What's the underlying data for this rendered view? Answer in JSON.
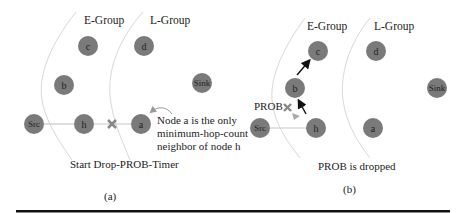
{
  "panels": [
    {
      "id": "a",
      "caption": "(a)",
      "groups": {
        "e_group": "E-Group",
        "l_group": "L-Group"
      },
      "nodes": {
        "src": "Src",
        "h": "h",
        "a": "a",
        "b": "b",
        "c": "c",
        "d": "d",
        "sink": "Sink"
      },
      "annotation": {
        "line1": "Node a  is the only",
        "line2": "minimum-hop-count",
        "line3": "neighbor of node h"
      },
      "status": "Start Drop-PROB-Timer"
    },
    {
      "id": "b",
      "caption": "(b)",
      "groups": {
        "e_group": "E-Group",
        "l_group": "L-Group"
      },
      "nodes": {
        "src": "Src",
        "h": "h",
        "a": "a",
        "b": "b",
        "c": "c",
        "d": "d",
        "sink": "Sink"
      },
      "packet_label": "PROB",
      "status": "PROB is dropped"
    }
  ],
  "colors": {
    "node_fill": "#7a7a7a",
    "link": "#c8c8c8",
    "arrow": "#111111",
    "boundary": "#d8d8d8",
    "bottom_rule": "#111111"
  }
}
